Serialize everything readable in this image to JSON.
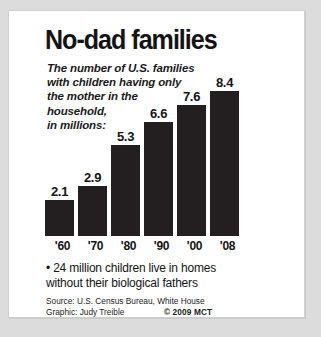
{
  "graphic": {
    "title": "No-dad families",
    "deck_lines": [
      "The number of U.S. families",
      "with children having only",
      "the mother in the",
      "household,",
      "in millions:"
    ],
    "note_lines": [
      "• 24 million children live in homes",
      "without their biological fathers"
    ],
    "credits": {
      "source": "Source: U.S. Census Bureau, White House",
      "graphic_by": "Graphic: Judy Treible",
      "copyright": "© 2009 MCT"
    },
    "colors": {
      "bar": "#231f20",
      "text": "#141414",
      "card": "#ffffff",
      "page": "#dcdcdc",
      "border": "#cfcfcf"
    }
  },
  "chart_data": {
    "type": "bar",
    "title": "No-dad families",
    "subtitle": "The number of U.S. families with children having only the mother in the household, in millions:",
    "categories": [
      "'60",
      "'70",
      "'80",
      "'90",
      "'00",
      "'08"
    ],
    "values": [
      2.1,
      2.9,
      5.3,
      6.6,
      7.6,
      8.4
    ],
    "value_labels": [
      "2.1",
      "2.9",
      "5.3",
      "6.6",
      "7.6",
      "8.4"
    ],
    "xlabel": "",
    "ylabel": "millions of families",
    "ylim": [
      0,
      8.4
    ],
    "grid": false,
    "legend": false,
    "annotations": [
      "• 24 million children live in homes without their biological fathers"
    ],
    "source": "U.S. Census Bureau, White House"
  }
}
